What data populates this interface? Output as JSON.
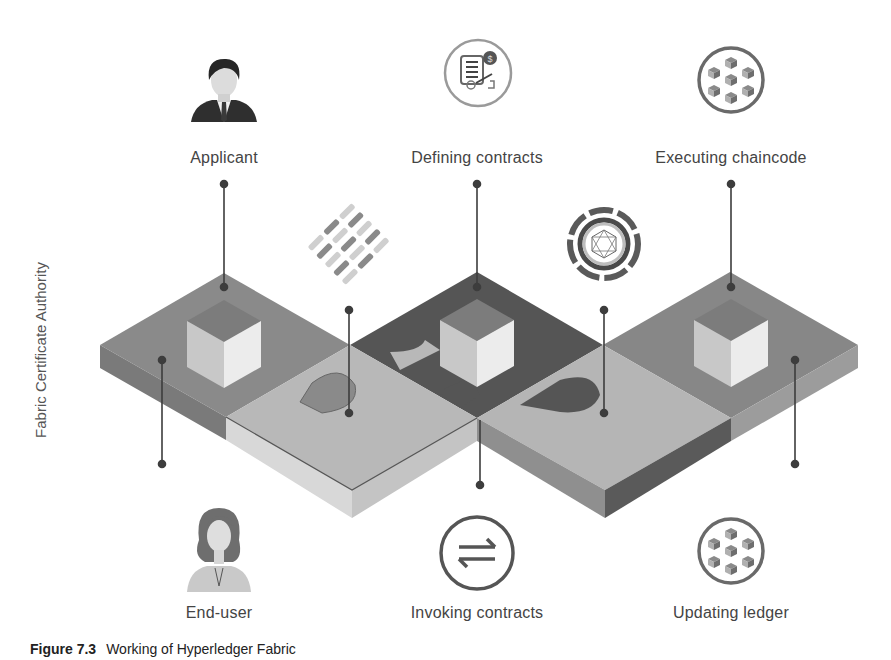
{
  "figure": {
    "side_label": "Fabric Certificate Authority",
    "caption": {
      "number": "Figure 7.3",
      "text": "Working of Hyperledger Fabric"
    },
    "top_nodes": [
      {
        "label": "Applicant",
        "icon": "male-user-icon"
      },
      {
        "label": "Defining contracts",
        "icon": "contract-document-icon"
      },
      {
        "label": "Executing chaincode",
        "icon": "cubes-cluster-icon"
      }
    ],
    "bottom_nodes": [
      {
        "label": "End-user",
        "icon": "female-user-icon"
      },
      {
        "label": "Invoking contracts",
        "icon": "exchange-arrows-icon"
      },
      {
        "label": "Updating ledger",
        "icon": "cubes-cluster-icon"
      }
    ],
    "floating_icons": [
      {
        "name": "woven-blocks-icon"
      },
      {
        "name": "network-ring-icon"
      }
    ],
    "colors": {
      "tile_mid": "#8a8a8a",
      "tile_light": "#b9b9b9",
      "tile_dark": "#555555",
      "cube_top": "#7c7c7c",
      "cube_left": "#c8c8c8",
      "cube_right": "#ececec",
      "line": "#3d3d3d"
    }
  }
}
